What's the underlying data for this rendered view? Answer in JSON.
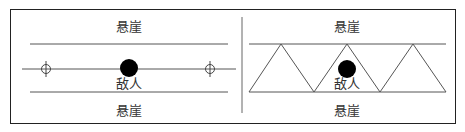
{
  "left_panel": {
    "top_label": "悬崖",
    "bottom_label": "悬崖",
    "enemy_label": "敌人"
  },
  "right_panel": {
    "top_label": "悬崖",
    "bottom_label": "悬崖",
    "enemy_label": "敌人"
  },
  "colors": {
    "line": "#555555",
    "border": "#222222",
    "enemy": "#000000"
  }
}
